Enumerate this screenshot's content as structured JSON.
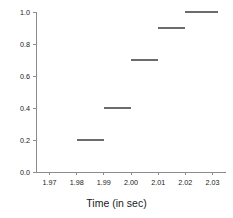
{
  "chart_data": {
    "type": "line",
    "title": "",
    "subtitle": "",
    "xlabel": "Time (in sec)",
    "ylabel": "",
    "xlim": [
      1.965,
      2.035
    ],
    "ylim": [
      0.0,
      1.0
    ],
    "grid": false,
    "legend": null,
    "style": "step",
    "line_color": "#6b6b6b",
    "axis_color": "#8c8c8c",
    "text_color": "#1a1a1a",
    "background_color": "#ffffff",
    "xticks": [
      1.97,
      1.98,
      1.99,
      2.0,
      2.01,
      2.02,
      2.03
    ],
    "xticklabels": [
      "1.97",
      "1.98",
      "1.99",
      "2.00",
      "2.01",
      "2.02",
      "2.03"
    ],
    "yticks": [
      0.0,
      0.2,
      0.4,
      0.6,
      0.8,
      1.0
    ],
    "yticklabels": [
      "0.0",
      "0.2",
      "0.4",
      "0.6",
      "0.8",
      "1.0"
    ],
    "steps": [
      {
        "x_start": 1.98,
        "x_end": 1.99,
        "y": 0.2
      },
      {
        "x_start": 1.99,
        "x_end": 2.0,
        "y": 0.4
      },
      {
        "x_start": 2.0,
        "x_end": 2.01,
        "y": 0.7
      },
      {
        "x_start": 2.01,
        "x_end": 2.02,
        "y": 0.9
      },
      {
        "x_start": 2.02,
        "x_end": 2.032,
        "y": 1.0
      }
    ],
    "x": [
      1.98,
      1.99,
      2.0,
      2.01,
      2.02
    ],
    "values": [
      0.2,
      0.4,
      0.7,
      0.9,
      1.0
    ]
  }
}
